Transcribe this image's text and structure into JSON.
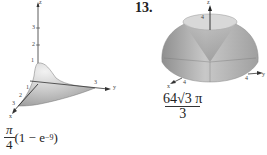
{
  "left_figure": {
    "axes": {
      "x_label": "x",
      "y_label": "y",
      "z_label": "z"
    },
    "z_ticks": [
      "1",
      "2",
      "3"
    ],
    "y_ticks": [
      "3"
    ],
    "x_ticks": [
      "1",
      "2",
      "3"
    ],
    "answer": {
      "numerator": "π",
      "denominator": "4",
      "tail": "(1 − e",
      "exponent": "−9",
      "close": ")"
    }
  },
  "right_figure": {
    "problem_number": "13.",
    "axes": {
      "x_label": "x",
      "y_label": "y",
      "z_label": "z"
    },
    "z_ticks": [
      "4"
    ],
    "x_ticks": [
      "4"
    ],
    "y_ticks": [
      "4"
    ],
    "answer": {
      "numerator": "64√3 π",
      "denominator": "3"
    }
  }
}
